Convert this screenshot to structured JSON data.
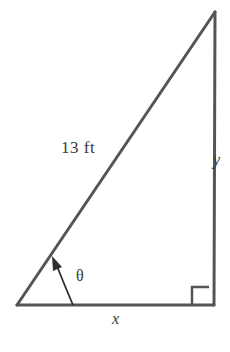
{
  "figure": {
    "kind": "right-triangle-diagram",
    "background_color": "#ffffff",
    "stroke_color": "#555555",
    "text_color": "#3a3a3a",
    "stroke_width": 3,
    "labels": {
      "hypotenuse": "13 ft",
      "vertical_side": "y",
      "horizontal_side": "x",
      "angle": "θ"
    },
    "geometry": {
      "apex": [
        215,
        12
      ],
      "bottom_left": [
        17,
        305
      ],
      "bottom_right": [
        214,
        305
      ],
      "right_angle_marker": {
        "x": 192,
        "y": 287,
        "size": 17
      },
      "angle_arc": {
        "start": [
          73,
          305
        ],
        "end": [
          56,
          263
        ],
        "control": [
          66,
          278
        ]
      },
      "arrow_head": true
    },
    "label_positions": {
      "hypotenuse": {
        "left": 61,
        "top": 139
      },
      "vertical_side": {
        "left": 213,
        "top": 152
      },
      "horizontal_side": {
        "left": 112,
        "top": 311
      },
      "angle": {
        "left": 76,
        "top": 268
      }
    }
  }
}
